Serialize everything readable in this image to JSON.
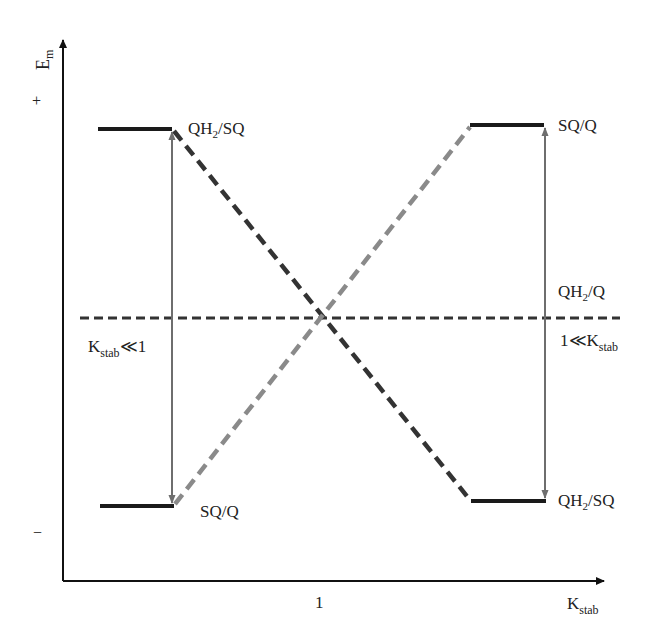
{
  "diagram": {
    "y_axis": {
      "label_main": "E",
      "label_sub": "m",
      "plus_sign": "+",
      "minus_sign": "−"
    },
    "x_axis": {
      "label_main": "K",
      "label_sub": "stab",
      "tick_label": "1"
    },
    "left": {
      "top_level": {
        "label_main": "QH",
        "label_sub": "2",
        "label_rest": "/SQ"
      },
      "bottom_level": {
        "label": "SQ/Q"
      },
      "regime": {
        "label_main": "K",
        "label_sub": "stab",
        "label_rest": "≪1"
      }
    },
    "right": {
      "top_level": {
        "label": "SQ/Q"
      },
      "bottom_level": {
        "label_main": "QH",
        "label_sub": "2",
        "label_rest": "/SQ"
      },
      "midpoint": {
        "label_main": "QH",
        "label_sub": "2",
        "label_rest": "/Q"
      },
      "regime": {
        "label_main": "1≪K",
        "label_sub": "stab"
      }
    },
    "colors": {
      "axis": "#111111",
      "level_bar": "#1a1a1a",
      "dashed_dark": "#333333",
      "dashed_light": "#8a8a8a",
      "arrow_gray": "#6e6e6e"
    }
  }
}
